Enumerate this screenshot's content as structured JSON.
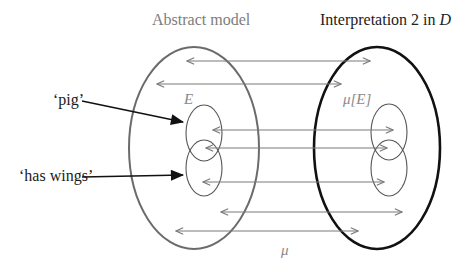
{
  "labels": {
    "abstract_model": "Abstract model",
    "interpretation_prefix": "Interpretation 2 in ",
    "interpretation_domain": "D",
    "term_pig": "‘pig’",
    "term_has_wings": "‘has wings’",
    "set_e": "E",
    "image_mu_e": "μ[E]",
    "mapping_mu": "μ"
  },
  "colors": {
    "abstract_ellipse": "#6b6b6b",
    "interpretation_ellipse": "#111111",
    "small_ellipse": "#555555",
    "mapping_arrow": "#7a7a7a",
    "term_arrow": "#111111",
    "abstract_label": "#7d7d7d",
    "interpretation_label": "#222222"
  },
  "shapes": {
    "abstract_model_ellipse": {
      "cx": 194,
      "cy": 148,
      "rx": 65,
      "ry": 101
    },
    "interpretation_ellipse": {
      "cx": 377,
      "cy": 148,
      "rx": 63,
      "ry": 101
    },
    "abstract_sub_ellipses": [
      {
        "name": "pig-set",
        "cx": 204,
        "cy": 133,
        "rx": 18,
        "ry": 28
      },
      {
        "name": "has-wings-set",
        "cx": 204,
        "cy": 168,
        "rx": 18,
        "ry": 28
      }
    ],
    "interpretation_sub_ellipses": [
      {
        "name": "pig-image",
        "cx": 389,
        "cy": 132,
        "rx": 18,
        "ry": 28
      },
      {
        "name": "has-wings-image",
        "cx": 389,
        "cy": 168,
        "rx": 18,
        "ry": 28
      }
    ]
  },
  "mapping_arrows": [
    {
      "y": 61,
      "x1": 187,
      "x2": 370
    },
    {
      "y": 84,
      "x1": 157,
      "x2": 341
    },
    {
      "y": 130,
      "x1": 213,
      "x2": 393
    },
    {
      "y": 148,
      "x1": 206,
      "x2": 387
    },
    {
      "y": 182,
      "x1": 203,
      "x2": 384
    },
    {
      "y": 212,
      "x1": 221,
      "x2": 402
    },
    {
      "y": 231,
      "x1": 176,
      "x2": 358
    }
  ],
  "term_arrows": [
    {
      "name": "pig",
      "x1": 82,
      "y1": 101,
      "x2": 183,
      "y2": 122
    },
    {
      "name": "has-wings",
      "x1": 82,
      "y1": 177,
      "x2": 183,
      "y2": 175
    }
  ]
}
